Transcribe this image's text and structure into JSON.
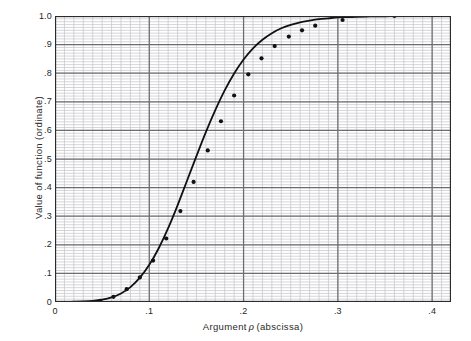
{
  "chart_data": {
    "type": "line",
    "title": "",
    "xlabel": "Argument ρ (abscissa)",
    "xlabel_prefix": "Argument",
    "xlabel_symbol": "ρ",
    "xlabel_suffix": "(abscissa)",
    "ylabel": "Value of function (ordinate)",
    "xlim": [
      0,
      0.42
    ],
    "ylim": [
      0,
      1.0
    ],
    "xticks": [
      0,
      0.1,
      0.2,
      0.3,
      0.4
    ],
    "xticklabels": [
      "0",
      ".1",
      ".2",
      ".3",
      ".4"
    ],
    "yticks": [
      0,
      0.1,
      0.2,
      0.3,
      0.4,
      0.5,
      0.6,
      0.7,
      0.8,
      0.9,
      1.0
    ],
    "yticklabels": [
      "0",
      ".1",
      ".2",
      ".3",
      ".4",
      ".5",
      ".6",
      ".7",
      ".8",
      ".9",
      "1.0"
    ],
    "grid": true,
    "grid_minor_x_step": 0.01,
    "grid_minor_y_step": 0.01,
    "grid_major_x_step": 0.1,
    "grid_major_y_step": 0.1,
    "legend": null,
    "series": [
      {
        "name": "function of argument rho",
        "marker": "filled-circle",
        "line_color": "#111111",
        "x": [
          0.0,
          0.01,
          0.02,
          0.03,
          0.04,
          0.05,
          0.06,
          0.07,
          0.08,
          0.09,
          0.1,
          0.11,
          0.12,
          0.13,
          0.14,
          0.15,
          0.16,
          0.17,
          0.18,
          0.19,
          0.2,
          0.21,
          0.22,
          0.23,
          0.24,
          0.25,
          0.26,
          0.27,
          0.28,
          0.29,
          0.3,
          0.31,
          0.32,
          0.33,
          0.34,
          0.35,
          0.36,
          0.37,
          0.38,
          0.39,
          0.4,
          0.41,
          0.42
        ],
        "y": [
          0.0,
          0.0,
          0.001,
          0.002,
          0.004,
          0.008,
          0.016,
          0.03,
          0.052,
          0.085,
          0.13,
          0.188,
          0.258,
          0.338,
          0.424,
          0.51,
          0.594,
          0.671,
          0.74,
          0.799,
          0.848,
          0.887,
          0.917,
          0.94,
          0.957,
          0.969,
          0.978,
          0.984,
          0.989,
          0.992,
          0.995,
          0.996,
          0.997,
          0.998,
          0.999,
          0.999,
          1.0,
          1.0,
          1.0,
          1.0,
          1.0,
          1.0,
          1.0
        ],
        "points_x": [
          0.048,
          0.062,
          0.076,
          0.09,
          0.104,
          0.118,
          0.133,
          0.147,
          0.162,
          0.176,
          0.19,
          0.205,
          0.219,
          0.233,
          0.248,
          0.262,
          0.276,
          0.305,
          0.36
        ],
        "points_y": [
          0.004,
          0.018,
          0.045,
          0.086,
          0.145,
          0.222,
          0.318,
          0.42,
          0.53,
          0.632,
          0.722,
          0.796,
          0.852,
          0.895,
          0.928,
          0.95,
          0.966,
          0.986,
          1.0
        ]
      }
    ]
  },
  "colors": {
    "curve": "#111111",
    "grid_minor": "#c3c3c8",
    "grid_major": "#6c6c74",
    "frame": "#2b2b2b",
    "paper": "#ffffff",
    "text": "#1f1f1f"
  }
}
